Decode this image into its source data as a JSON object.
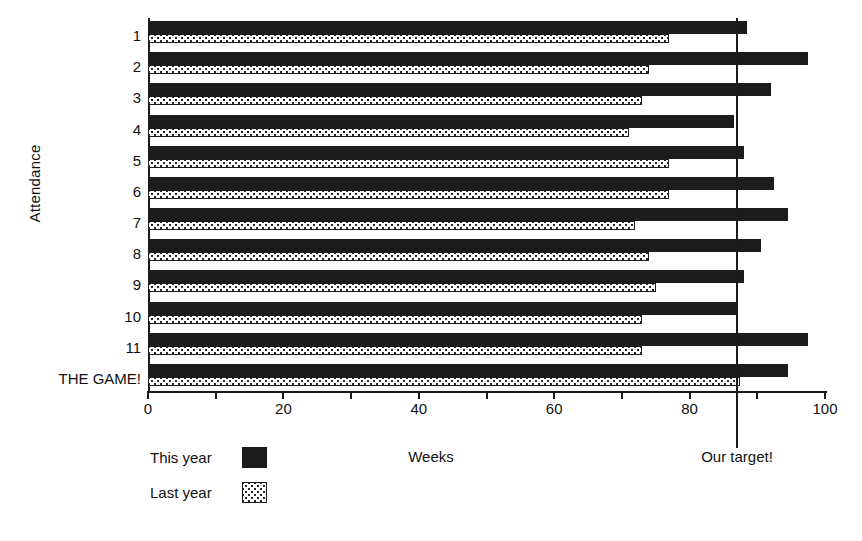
{
  "chart_data": {
    "type": "bar",
    "orientation": "horizontal",
    "title": "",
    "xlabel": "Weeks",
    "ylabel": "Attendance",
    "xlim": [
      0,
      100
    ],
    "xticks": [
      0,
      10,
      20,
      30,
      40,
      50,
      60,
      70,
      80,
      90,
      100
    ],
    "xtick_labels": [
      "0",
      "",
      "20",
      "",
      "40",
      "",
      "60",
      "",
      "80",
      "",
      "100"
    ],
    "grid": false,
    "legend_position": "bottom-left",
    "categories": [
      "1",
      "2",
      "3",
      "4",
      "5",
      "6",
      "7",
      "8",
      "9",
      "10",
      "11",
      "THE GAME!"
    ],
    "series": [
      {
        "name": "This year",
        "color": "#1c1c1c",
        "pattern": "solid",
        "values": [
          88.5,
          97.5,
          92,
          86.5,
          88,
          92.5,
          94.5,
          90.5,
          88,
          87,
          97.5,
          94.5
        ]
      },
      {
        "name": "Last year",
        "color": "#ffffff",
        "pattern": "dotted",
        "values": [
          77,
          74,
          73,
          71,
          77,
          77,
          72,
          74,
          75,
          73,
          73,
          87.5
        ]
      }
    ],
    "annotations": [
      {
        "name": "target-line",
        "label": "Our target!",
        "value": 87,
        "orientation": "vertical"
      }
    ]
  },
  "legend": {
    "items": [
      {
        "label": "This year",
        "swatch": "solid-black-swatch"
      },
      {
        "label": "Last year",
        "swatch": "dotted-swatch"
      }
    ]
  }
}
